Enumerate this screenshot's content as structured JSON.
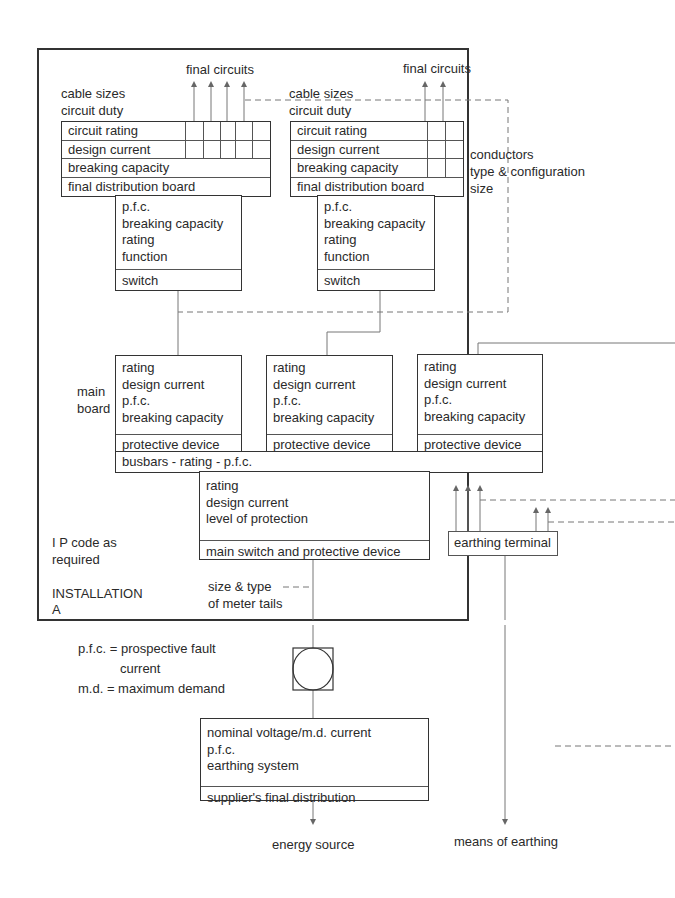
{
  "diagram": {
    "installation_label": "INSTALLATION\nA",
    "ip_code_note": [
      "I P code as",
      "required"
    ],
    "final_circuits_left": "final circuits",
    "final_circuits_right": "final circuits",
    "cable_notes_left": [
      "cable sizes",
      "circuit duty"
    ],
    "cable_notes_right": [
      "cable sizes",
      "circuit duty"
    ],
    "conductors_note": [
      "conductors",
      "type & configuration",
      "size"
    ],
    "main_board_label": [
      "main",
      "board"
    ],
    "meter_tails_note": [
      "size & type",
      "of meter tails"
    ],
    "legend": {
      "pfc": "p.f.c. = prospective fault",
      "pfc_cont": "current",
      "md": "m.d. = maximum demand"
    },
    "energy_source": "energy source",
    "means_of_earthing": "means of earthing"
  },
  "boards": {
    "fdb_left": {
      "rows": [
        "circuit rating",
        "design current",
        "breaking capacity",
        "final distribution board"
      ]
    },
    "fdb_right": {
      "rows": [
        "circuit rating",
        "design current",
        "breaking capacity",
        "final distribution board"
      ]
    },
    "switch_left": {
      "lines": [
        "p.f.c.",
        "breaking capacity",
        "rating",
        "function"
      ],
      "footer": "switch"
    },
    "switch_right": {
      "lines": [
        "p.f.c.",
        "breaking capacity",
        "rating",
        "function"
      ],
      "footer": "switch"
    },
    "main_1": {
      "lines": [
        "rating",
        "design current",
        "p.f.c.",
        "breaking capacity"
      ],
      "footer": "protective device"
    },
    "main_2": {
      "lines": [
        "rating",
        "design current",
        "p.f.c.",
        "breaking capacity"
      ],
      "footer": "protective device"
    },
    "main_3": {
      "lines": [
        "rating",
        "design current",
        "p.f.c.",
        "breaking capacity"
      ],
      "footer": "protective device"
    },
    "busbars": "busbars - rating - p.f.c.",
    "main_switch": {
      "lines": [
        "rating",
        "design current",
        "level of protection"
      ],
      "footer": "main switch and protective device"
    },
    "earthing_terminal": "earthing terminal",
    "supplier": {
      "lines": [
        "nominal voltage/m.d. current",
        "p.f.c.",
        "earthing system"
      ],
      "footer": "supplier's final distribution"
    }
  },
  "colors": {
    "line": "#333333",
    "thin_line": "#777777",
    "text": "#2a2a2a"
  }
}
